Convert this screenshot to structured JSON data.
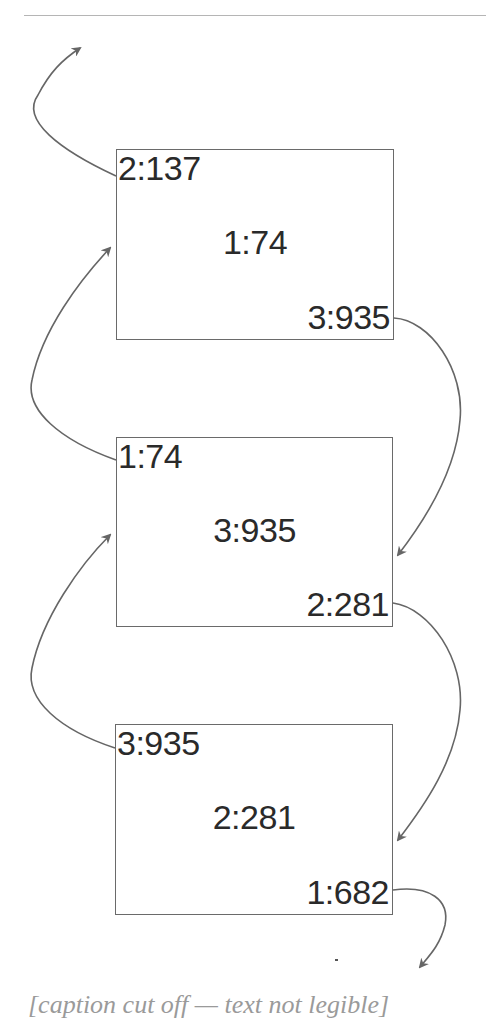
{
  "diagram": {
    "type": "linked-list",
    "line_color": "#666666",
    "box_border_color": "#6a6a6a",
    "text_color": "#2a2a2a",
    "nodes": [
      {
        "prev": "2:137",
        "value": "1:74",
        "next": "3:935"
      },
      {
        "prev": "1:74",
        "value": "3:935",
        "next": "2:281"
      },
      {
        "prev": "3:935",
        "value": "2:281",
        "next": "1:682"
      }
    ],
    "edges": [
      {
        "from": "node-1.prev",
        "to": "offscreen-top-left",
        "kind": "prev-pointer"
      },
      {
        "from": "node-1.next",
        "to": "node-2",
        "kind": "next-pointer"
      },
      {
        "from": "node-2.prev",
        "to": "node-1",
        "kind": "prev-pointer"
      },
      {
        "from": "node-2.next",
        "to": "node-3",
        "kind": "next-pointer"
      },
      {
        "from": "node-3.prev",
        "to": "node-2",
        "kind": "prev-pointer"
      },
      {
        "from": "node-3.next",
        "to": "offscreen-bottom-right",
        "kind": "next-pointer"
      }
    ]
  },
  "caption": {
    "text": "[caption cut off — text not legible]",
    "note": "Only the top edge of a caption line is visible at the bottom of the image; its wording and figure number cannot be read"
  }
}
